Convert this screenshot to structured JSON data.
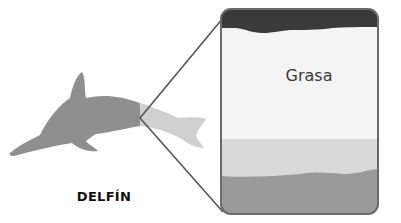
{
  "diagram": {
    "type": "anatomy-zoom-callout",
    "subject": {
      "label": "DELFÍN",
      "icon": "dolphin-silhouette-icon"
    },
    "callout": {
      "description": "Magnified cross-section of dolphin skin layers",
      "layers": [
        {
          "name": "outer-skin",
          "label": "",
          "color": "#3a3a3a"
        },
        {
          "name": "blubber",
          "label": "Grasa",
          "color": "#f4f4f4"
        },
        {
          "name": "middle-layer",
          "label": "",
          "color": "#d9d9d9"
        },
        {
          "name": "muscle",
          "label": "",
          "color": "#9a9a9a"
        }
      ]
    },
    "colors": {
      "dolphin_body": "#8f8f8f",
      "dolphin_tail": "#cfcfcf",
      "outline": "#5a5a5a",
      "text": "#111111"
    }
  }
}
